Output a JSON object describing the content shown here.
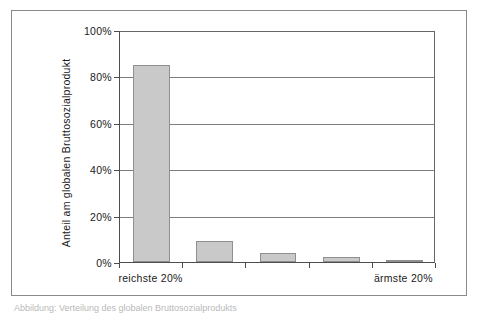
{
  "figure": {
    "caption": "Abbildung: Verteilung des globalen Bruttosozialprodukts"
  },
  "chart_data": {
    "type": "bar",
    "title": "",
    "subtitle": "",
    "xlabel": "",
    "ylabel": "Anteil am globalen Bruttosozialprodukt",
    "categories": [
      "reichste 20%",
      "",
      "",
      "",
      "ärmste 20%"
    ],
    "values": [
      85,
      9,
      4,
      2,
      1
    ],
    "value_unit": "%",
    "ylim": [
      0,
      100
    ],
    "ytick_labels": [
      "0%",
      "20%",
      "40%",
      "60%",
      "80%",
      "100%"
    ],
    "ytick_values": [
      0,
      20,
      40,
      60,
      80,
      100
    ],
    "xtick_labels": [
      "reichste 20%",
      "ärmste 20%"
    ],
    "grid": "horizontal",
    "legend": "none",
    "bar_fill_color": "#c9c9c9",
    "bar_border_color": "#8f8f8f",
    "axis_color": "#4d4d4d",
    "gridline_color": "#7d7d7d",
    "background_color": "#ffffff"
  }
}
